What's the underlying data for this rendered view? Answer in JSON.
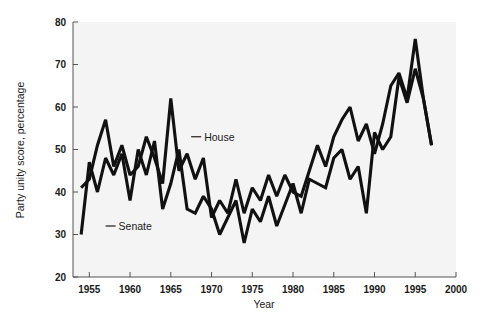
{
  "chart_data": {
    "type": "line",
    "title": "",
    "subtitle": "",
    "xlabel": "Year",
    "ylabel": "Party unity score, percentage",
    "xlim": [
      1953,
      2000
    ],
    "ylim": [
      20,
      80
    ],
    "xticks": [
      1955,
      1960,
      1965,
      1970,
      1975,
      1980,
      1985,
      1990,
      1995,
      2000
    ],
    "xtick_labels": [
      "1955",
      "1960",
      "1965",
      "1970",
      "1975",
      "1980",
      "1985",
      "1990",
      "1995",
      "2000"
    ],
    "yticks": [
      20,
      30,
      40,
      50,
      60,
      70,
      80
    ],
    "ytick_labels": [
      "20",
      "30",
      "40",
      "50",
      "60",
      "70",
      "80"
    ],
    "grid": false,
    "legend_position": "inline-annotation",
    "line_color": "#111111",
    "background_color": "#f4f4f4",
    "series": [
      {
        "name": "House",
        "label_x": 1967.5,
        "label_y": 53,
        "x": [
          1954,
          1955,
          1956,
          1957,
          1958,
          1959,
          1960,
          1961,
          1962,
          1963,
          1964,
          1965,
          1966,
          1967,
          1968,
          1969,
          1970,
          1971,
          1972,
          1973,
          1974,
          1975,
          1976,
          1977,
          1978,
          1979,
          1980,
          1981,
          1982,
          1983,
          1984,
          1985,
          1986,
          1987,
          1988,
          1989,
          1990,
          1991,
          1992,
          1993,
          1994,
          1995,
          1996,
          1997
        ],
        "values": [
          41,
          43,
          51,
          57,
          46,
          51,
          44,
          46,
          53,
          48,
          42,
          62,
          45,
          49,
          43,
          48,
          34,
          38,
          35,
          43,
          35,
          41,
          38,
          44,
          39,
          44,
          40,
          39,
          45,
          51,
          46,
          53,
          57,
          60,
          52,
          56,
          49,
          56,
          65,
          68,
          62,
          76,
          62,
          51
        ]
      },
      {
        "name": "Senate",
        "label_x": 1957.0,
        "label_y": 32,
        "x": [
          1954,
          1955,
          1956,
          1957,
          1958,
          1959,
          1960,
          1961,
          1962,
          1963,
          1964,
          1965,
          1966,
          1967,
          1968,
          1969,
          1970,
          1971,
          1972,
          1973,
          1974,
          1975,
          1976,
          1977,
          1978,
          1979,
          1980,
          1981,
          1982,
          1983,
          1984,
          1985,
          1986,
          1987,
          1988,
          1989,
          1990,
          1991,
          1992,
          1993,
          1994,
          1995,
          1996,
          1997
        ],
        "values": [
          30,
          47,
          40,
          48,
          44,
          49,
          38,
          50,
          44,
          52,
          36,
          42,
          50,
          36,
          35,
          39,
          36,
          30,
          34,
          38,
          28,
          36,
          33,
          39,
          32,
          37,
          42,
          35,
          43,
          42,
          41,
          48,
          50,
          43,
          46,
          35,
          54,
          50,
          53,
          67,
          61,
          69,
          62,
          51
        ]
      }
    ]
  },
  "axis": {
    "x_title": "Year",
    "y_title": "Party unity score, percentage"
  }
}
